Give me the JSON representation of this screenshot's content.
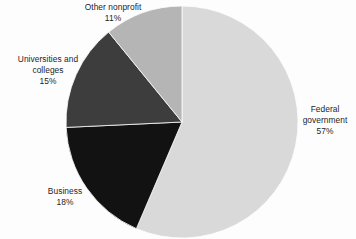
{
  "chart_data": {
    "type": "pie",
    "title": "",
    "subtitle": "",
    "xlabel": "",
    "ylabel": "",
    "legend_position": "none",
    "grid": false,
    "unit": "%",
    "start_angle_deg": 0,
    "direction": "clockwise",
    "categories": [
      "Federal government",
      "Business",
      "Universities and colleges",
      "Other nonprofit"
    ],
    "values": [
      57,
      18,
      15,
      11
    ],
    "slices": [
      {
        "label": "Federal government",
        "label_line1": "Federal",
        "label_line2": "government",
        "value": 57,
        "value_text": "57%",
        "color": "#d9d9d9"
      },
      {
        "label": "Business",
        "label_line1": "Business",
        "label_line2": "",
        "value": 18,
        "value_text": "18%",
        "color": "#121212"
      },
      {
        "label": "Universities and colleges",
        "label_line1": "Universities and",
        "label_line2": "colleges",
        "value": 15,
        "value_text": "15%",
        "color": "#3d3d3d"
      },
      {
        "label": "Other nonprofit",
        "label_line1": "Other nonprofit",
        "label_line2": "",
        "value": 11,
        "value_text": "11%",
        "color": "#b5b5b5"
      }
    ]
  },
  "canvas": {
    "background": "#fdfdfd",
    "center_x": 182,
    "center_y": 122,
    "radius": 116,
    "separator_color": "#fdfdfd"
  }
}
